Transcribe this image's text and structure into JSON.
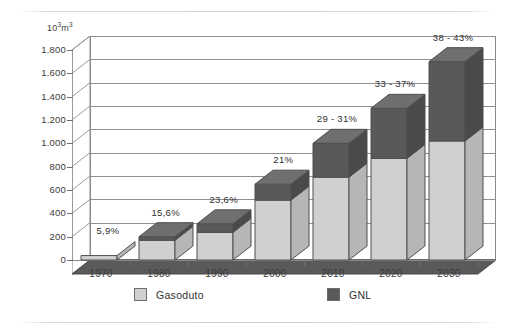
{
  "chart_data": {
    "type": "bar",
    "subtype": "stacked-column-3d",
    "title": "",
    "xlabel": "",
    "ylabel": "10³m³",
    "ylim": [
      0,
      1800
    ],
    "ytick_step": 200,
    "grid": true,
    "legend_position": "bottom",
    "categories": [
      "1970",
      "1980",
      "1990",
      "2000",
      "2010",
      "2020",
      "2030"
    ],
    "ytick_labels": [
      "0",
      "200",
      "400",
      "600",
      "800",
      "1.000",
      "1.200",
      "1.400",
      "1.600",
      "1.800"
    ],
    "ytick_values": [
      0,
      200,
      400,
      600,
      800,
      1000,
      1200,
      1400,
      1600,
      1800
    ],
    "series": [
      {
        "name": "Gasoduto",
        "color": "#d0d0d0",
        "values": [
          38,
          169,
          237,
          513,
          710,
          871,
          1020
        ]
      },
      {
        "name": "GNL",
        "color": "#595959",
        "values": [
          2,
          31,
          73,
          137,
          290,
          429,
          680
        ]
      }
    ],
    "totals": [
      40,
      200,
      310,
      650,
      1000,
      1300,
      1700
    ],
    "annotations": [
      "5,9%",
      "15,6%",
      "23,6%",
      "21%",
      "29 - 31%",
      "33 - 37%",
      "38 - 43%"
    ],
    "annotation_note": "GNL share of total"
  },
  "axis": {
    "unit_label_prefix": "10",
    "unit_label_sup1": "3",
    "unit_label_suffix": "m",
    "unit_label_sup2": "3"
  },
  "legend": {
    "items": [
      {
        "label": "Gasoduto",
        "color": "#d0d0d0"
      },
      {
        "label": "GNL",
        "color": "#595959"
      }
    ]
  },
  "colors": {
    "gasoduto": "#d0d0d0",
    "gasoduto_side": "#b6b6b6",
    "gasoduto_top": "#e2e2e2",
    "gnl": "#595959",
    "gnl_side": "#4a4a4a",
    "gnl_top": "#6f6f6f",
    "floor": "#5a5a5a",
    "wall": "#ffffff",
    "grid": "#8f8f8f",
    "text": "#2f2f2f",
    "background": "#ffffff"
  }
}
